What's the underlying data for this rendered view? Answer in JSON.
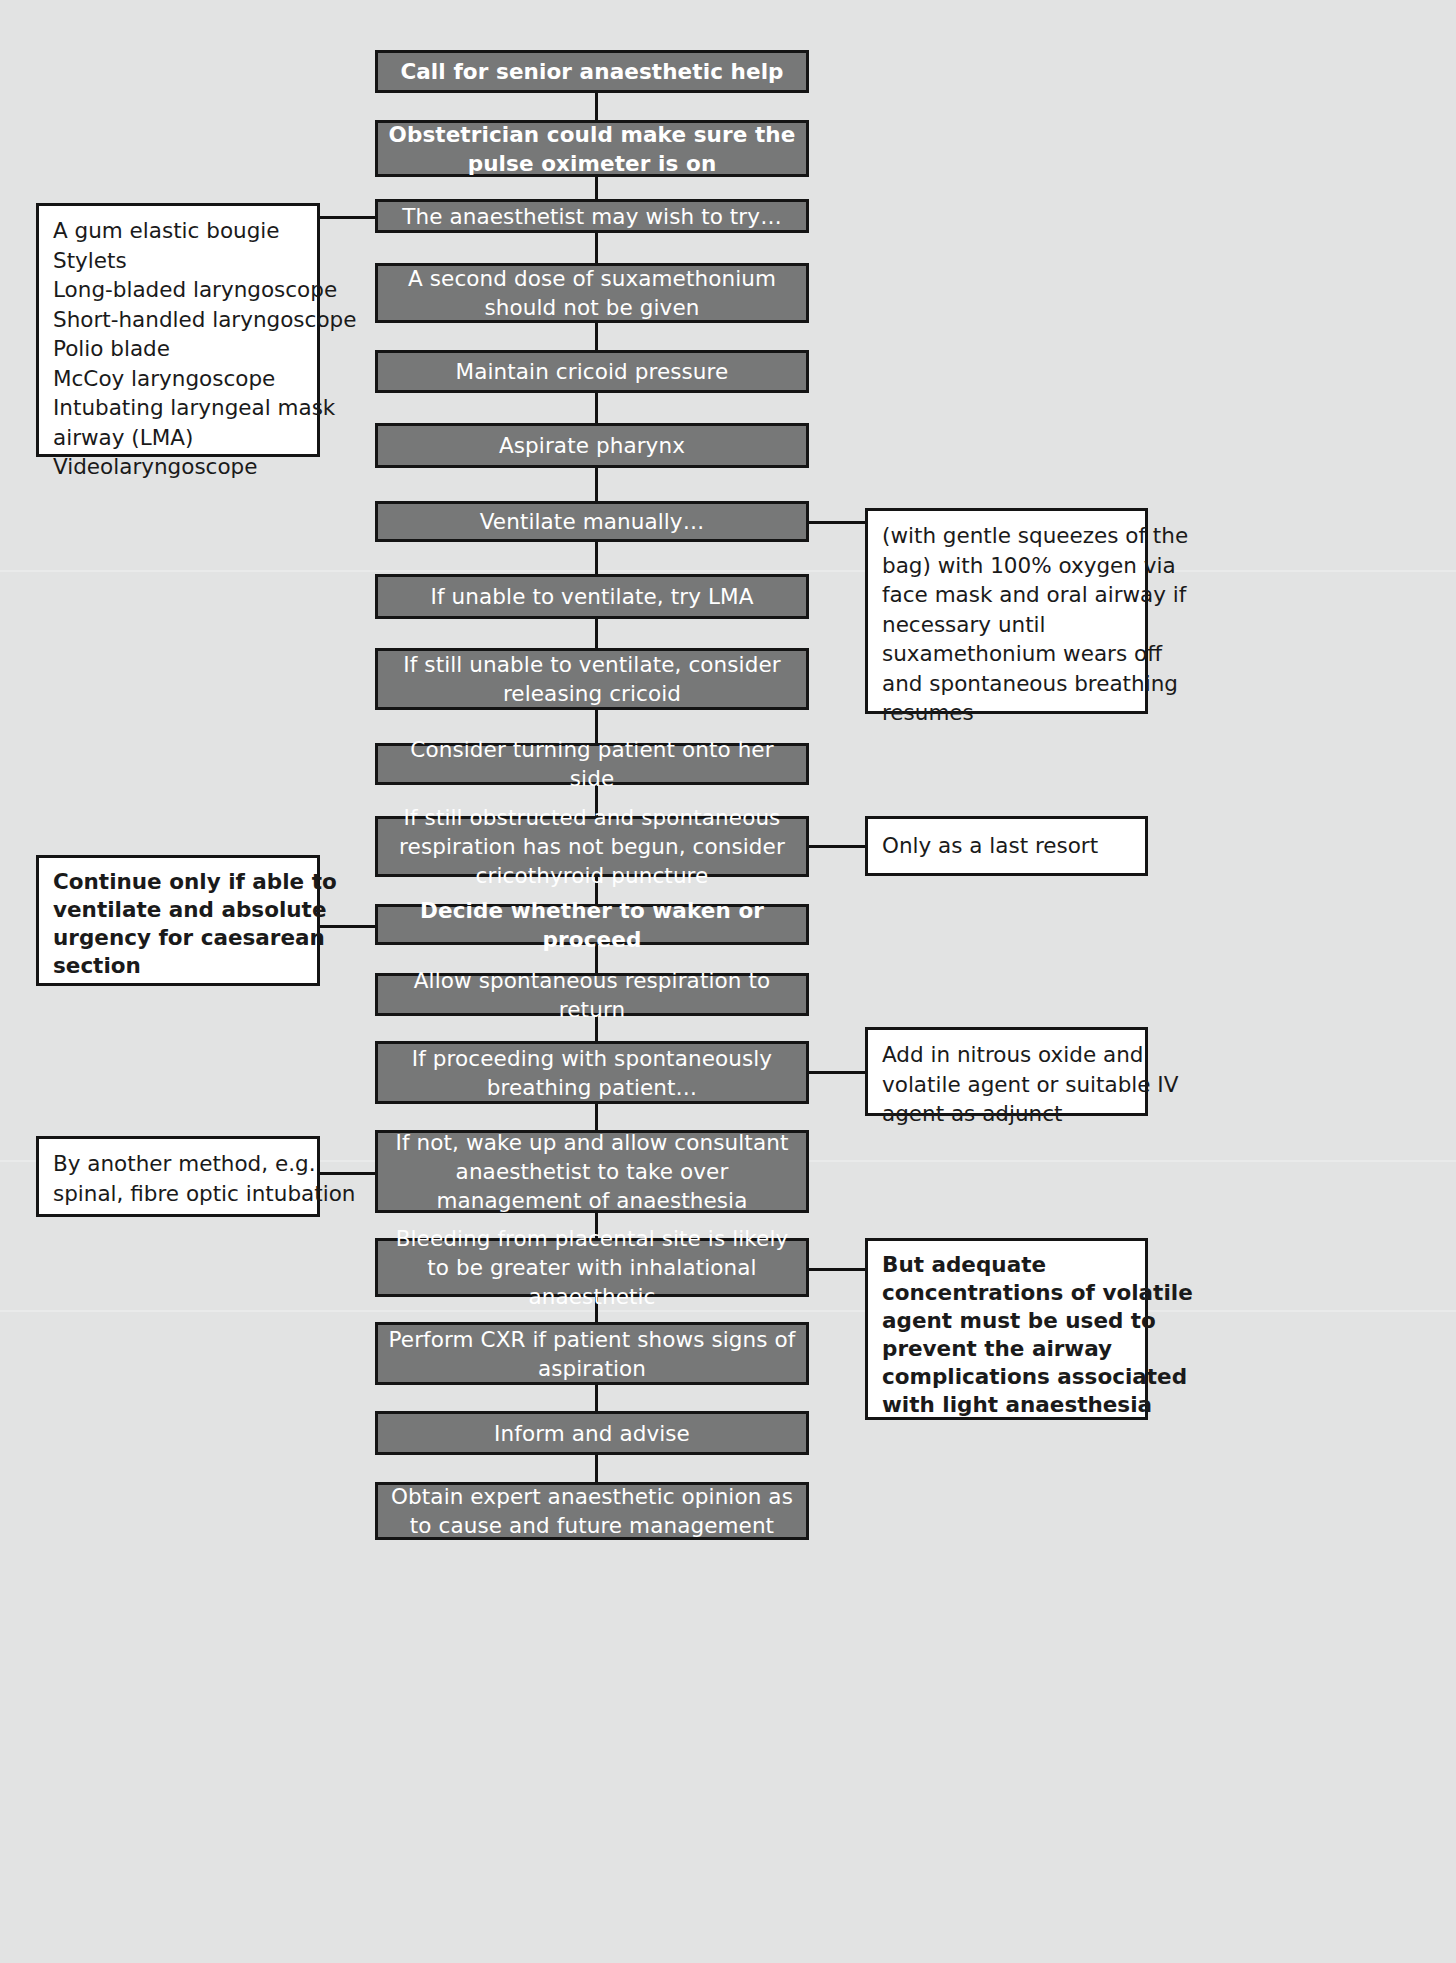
{
  "diagram": {
    "accent_box_color": "#777878",
    "note_box_color": "#ffffff",
    "line_color": "#141414",
    "background_color": "#e2e3e3"
  },
  "flow": [
    {
      "id": "call-help",
      "text": "Call for senior anaesthetic help",
      "bold": true
    },
    {
      "id": "obstetrician",
      "text": "Obstetrician could make sure the pulse oximeter is on",
      "bold": true
    },
    {
      "id": "may-wish-try",
      "text": "The anaesthetist may wish to try…",
      "bold": false
    },
    {
      "id": "second-dose",
      "text": "A second dose of suxamethonium should not be given",
      "bold": false
    },
    {
      "id": "cricoid",
      "text": "Maintain cricoid pressure",
      "bold": false
    },
    {
      "id": "aspirate",
      "text": "Aspirate pharynx",
      "bold": false
    },
    {
      "id": "ventilate",
      "text": "Ventilate manually…",
      "bold": false
    },
    {
      "id": "try-lma",
      "text": "If unable to ventilate, try LMA",
      "bold": false
    },
    {
      "id": "release-cricoid",
      "text": "If still unable to ventilate, consider releasing cricoid",
      "bold": false
    },
    {
      "id": "turn-side",
      "text": "Consider turning patient onto her side",
      "bold": false
    },
    {
      "id": "cricothyroid",
      "text": "If still obstructed and spontaneous respiration has not begun, consider cricothyroid puncture",
      "bold": false
    },
    {
      "id": "waken-proceed",
      "text": "Decide whether to waken or proceed",
      "bold": true
    },
    {
      "id": "allow-spont",
      "text": "Allow spontaneous respiration to return",
      "bold": false
    },
    {
      "id": "if-proceeding",
      "text": "If proceeding with spontaneously breathing patient…",
      "bold": false
    },
    {
      "id": "if-not-wake",
      "text": "If not, wake up and allow consultant anaesthetist to take over management of anaesthesia",
      "bold": false
    },
    {
      "id": "bleeding",
      "text": "Bleeding from placental site is likely to be greater with inhalational anaesthetic",
      "bold": false
    },
    {
      "id": "cxr",
      "text": "Perform CXR if patient shows signs of aspiration",
      "bold": false
    },
    {
      "id": "inform",
      "text": "Inform and advise",
      "bold": false
    },
    {
      "id": "expert-opinion",
      "text": "Obtain expert anaesthetic opinion as to cause and future management",
      "bold": false
    }
  ],
  "notes": {
    "equipment_list": {
      "side": "left",
      "bold": false,
      "lines": [
        "A gum elastic bougie",
        "Stylets",
        "Long-bladed laryngoscope",
        "Short-handled laryngoscope",
        "Polio blade",
        "McCoy laryngoscope",
        "Intubating laryngeal mask",
        "airway (LMA)",
        "Videolaryngoscope"
      ]
    },
    "ventilate_detail": {
      "side": "right",
      "bold": false,
      "lines": [
        "(with gentle squeezes of the",
        "bag) with 100% oxygen via",
        "face mask and oral airway if",
        "necessary until",
        "suxamethonium wears off",
        "and spontaneous breathing",
        "resumes"
      ]
    },
    "last_resort": {
      "side": "right",
      "bold": false,
      "lines": [
        "Only as a last resort"
      ]
    },
    "continue_only_if": {
      "side": "left",
      "bold": true,
      "lines": [
        "Continue only if able to",
        "ventilate and absolute",
        "urgency for caesarean",
        "section"
      ]
    },
    "add_nitrous": {
      "side": "right",
      "bold": false,
      "lines": [
        "Add in nitrous oxide and",
        "volatile agent or suitable IV",
        "agent as adjunct"
      ]
    },
    "another_method": {
      "side": "left",
      "bold": false,
      "lines": [
        "By another method, e.g.",
        "spinal, fibre optic intubation"
      ]
    },
    "adequate_concentrations": {
      "side": "right",
      "bold": true,
      "lines": [
        "But adequate",
        "concentrations of volatile",
        "agent must be used to",
        "prevent the airway",
        "complications associated",
        "with light anaesthesia"
      ]
    }
  }
}
